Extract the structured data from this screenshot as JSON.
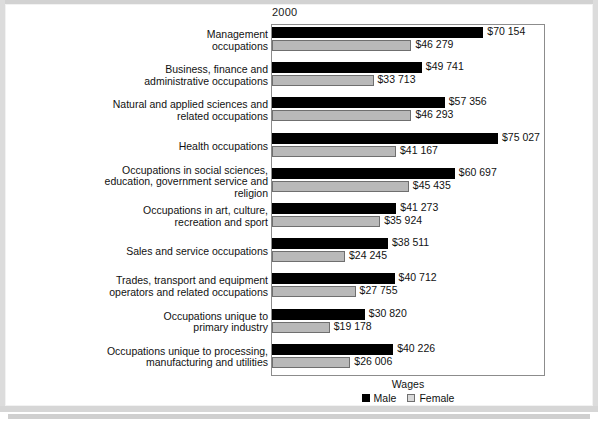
{
  "chart_data": {
    "type": "bar",
    "orientation": "horizontal",
    "title": "2000",
    "xlabel": "Wages",
    "ylabel": "",
    "grid": false,
    "legend_position": "bottom-center",
    "xlim": [
      0,
      91000
    ],
    "categories": [
      "Management occupations",
      "Business, finance and administrative occupations",
      "Natural and applied sciences and related occupations",
      "Health occupations",
      "Occupations in social sciences, education, government service and religion",
      "Occupations in art, culture, recreation and sport",
      "Sales and service occupations",
      "Trades, transport and equipment operators and related occupations",
      "Occupations unique to primary industry",
      "Occupations unique to processing, manufacturing and utilities"
    ],
    "series": [
      {
        "name": "Male",
        "color": "#000000",
        "values": [
          70154,
          49741,
          57356,
          75027,
          60697,
          41273,
          38511,
          40712,
          30820,
          40226
        ],
        "labels": [
          "$70 154",
          "$49 741",
          "$57 356",
          "$75 027",
          "$60 697",
          "$41 273",
          "$38 511",
          "$40 712",
          "$30 820",
          "$40 226"
        ]
      },
      {
        "name": "Female",
        "color": "#b9b9b9",
        "values": [
          46279,
          33713,
          46293,
          41167,
          45435,
          35924,
          24245,
          27755,
          19178,
          26006
        ],
        "labels": [
          "$46 279",
          "$33 713",
          "$46 293",
          "$41 167",
          "$45 435",
          "$35 924",
          "$24 245",
          "$27 755",
          "$19 178",
          "$26 006"
        ]
      }
    ]
  },
  "categories_display": [
    {
      "lines": [
        "Management",
        "occupations"
      ]
    },
    {
      "lines": [
        "Business, finance and",
        "administrative occupations"
      ]
    },
    {
      "lines": [
        "Natural and applied sciences and",
        "related occupations"
      ]
    },
    {
      "lines": [
        "Health occupations"
      ]
    },
    {
      "lines": [
        "Occupations in social sciences,",
        "education, government service and",
        "religion"
      ]
    },
    {
      "lines": [
        "Occupations in art, culture,",
        "recreation and sport"
      ]
    },
    {
      "lines": [
        "Sales and service occupations"
      ]
    },
    {
      "lines": [
        "Trades, transport and equipment",
        "operators and related occupations"
      ]
    },
    {
      "lines": [
        "Occupations unique to",
        "primary industry"
      ]
    },
    {
      "lines": [
        "Occupations unique to processing,",
        "manufacturing and utilities"
      ]
    }
  ],
  "legend": {
    "items": [
      {
        "label": "Male",
        "swatch": "filled-square-black"
      },
      {
        "label": "Female",
        "swatch": "open-square-gray"
      }
    ]
  },
  "axis": {
    "x_title": "Wages"
  },
  "colors": {
    "male_bar": "#000000",
    "female_bar": "#b9b9b9",
    "female_bar_border": "#6f6f6f",
    "plot_border": "#8c8c8c",
    "text": "#111111",
    "page_background": "#ffffff"
  }
}
